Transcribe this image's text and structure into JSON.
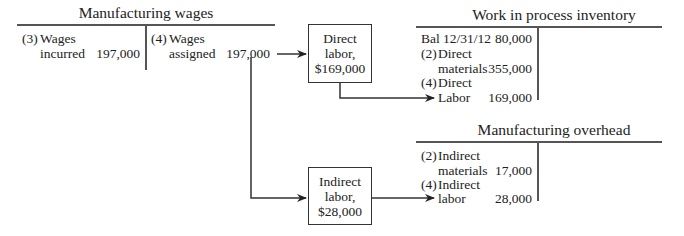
{
  "manufacturing_wages": {
    "title": "Manufacturing wages",
    "debit": [
      {
        "ref": "(3)",
        "line1": "Wages",
        "line2": "incurred",
        "amount": "197,000"
      }
    ],
    "credit": [
      {
        "ref": "(4)",
        "line1": "Wages",
        "line2": "assigned",
        "amount": "197,000"
      }
    ]
  },
  "direct_labor_box": {
    "line1": "Direct",
    "line2": "labor,",
    "line3": "$169,000"
  },
  "indirect_labor_box": {
    "line1": "Indirect",
    "line2": "labor,",
    "line3": "$28,000"
  },
  "work_in_process": {
    "title": "Work in process inventory",
    "debit": [
      {
        "label": "Bal 12/31/12",
        "amount": "80,000"
      },
      {
        "ref": "(2)",
        "line1": "Direct",
        "line2": "materials",
        "amount": "355,000"
      },
      {
        "ref": "(4)",
        "line1": "Direct",
        "line2": "Labor",
        "amount": "169,000"
      }
    ]
  },
  "manufacturing_overhead": {
    "title": "Manufacturing overhead",
    "debit": [
      {
        "ref": "(2)",
        "line1": "Indirect",
        "line2": "materials",
        "amount": "17,000"
      },
      {
        "ref": "(4)",
        "line1": "Indirect",
        "line2": "labor",
        "amount": "28,000"
      }
    ]
  }
}
